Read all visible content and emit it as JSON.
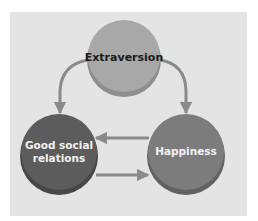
{
  "diagram": {
    "nodes": [
      {
        "id": "extraversion",
        "label_lines": [
          "Extraversion"
        ],
        "fill": "#a8a8a8",
        "rim": "#8e8e8e",
        "text_color": "#1a1a1a"
      },
      {
        "id": "good-social-relations",
        "label_lines": [
          "Good social",
          "relations"
        ],
        "fill": "#5c5c5c",
        "rim": "#474747",
        "text_color": "#f2f2f2"
      },
      {
        "id": "happiness",
        "label_lines": [
          "Happiness"
        ],
        "fill": "#7c7c7c",
        "rim": "#626262",
        "text_color": "#f2f2f2"
      }
    ],
    "edges": [
      {
        "from": "extraversion",
        "to": "good-social-relations"
      },
      {
        "from": "extraversion",
        "to": "happiness"
      },
      {
        "from": "happiness",
        "to": "good-social-relations"
      },
      {
        "from": "good-social-relations",
        "to": "happiness"
      }
    ],
    "colors": {
      "panel": "#e4e4e4",
      "arrow": "#8a8a8a"
    }
  }
}
